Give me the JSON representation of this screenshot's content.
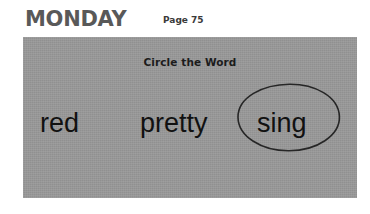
{
  "header": {
    "day_title": "MONDAY",
    "page_label": "Page 75"
  },
  "activity": {
    "instruction": "Circle the Word",
    "words": [
      {
        "text": "red",
        "circled": false
      },
      {
        "text": "pretty",
        "circled": false
      },
      {
        "text": "sing",
        "circled": true
      }
    ],
    "circled_answer": "sing"
  },
  "colors": {
    "page_background": "#ffffff",
    "panel_background": "#989898",
    "day_title_color": "#595959",
    "word_color": "#111111",
    "instruction_color": "#1c1c1c",
    "circle_stroke": "#262626"
  }
}
